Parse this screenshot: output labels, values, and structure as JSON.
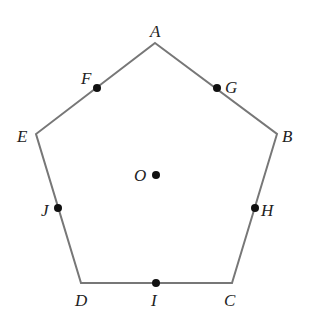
{
  "diagram": {
    "title": "",
    "shape": "regular pentagon",
    "stroke_color": "#777777",
    "point_color": "#111111",
    "vertices": [
      {
        "label": "A",
        "x": 155,
        "y": 43,
        "lx": 150,
        "ly": 37
      },
      {
        "label": "B",
        "x": 277,
        "y": 134,
        "lx": 282,
        "ly": 142
      },
      {
        "label": "C",
        "x": 232,
        "y": 283,
        "lx": 224,
        "ly": 306
      },
      {
        "label": "D",
        "x": 81,
        "y": 283,
        "lx": 75,
        "ly": 306
      },
      {
        "label": "E",
        "x": 36,
        "y": 134,
        "lx": 17,
        "ly": 142
      }
    ],
    "midpoints": [
      {
        "label": "F",
        "x": 97,
        "y": 88,
        "lx": 81,
        "ly": 84
      },
      {
        "label": "G",
        "x": 217,
        "y": 88,
        "lx": 225,
        "ly": 93
      },
      {
        "label": "H",
        "x": 255,
        "y": 208,
        "lx": 261,
        "ly": 216
      },
      {
        "label": "I",
        "x": 156,
        "y": 283,
        "lx": 151,
        "ly": 306
      },
      {
        "label": "J",
        "x": 58,
        "y": 208,
        "lx": 41,
        "ly": 216
      }
    ],
    "center": {
      "label": "O",
      "x": 156,
      "y": 175,
      "lx": 134,
      "ly": 181
    }
  }
}
